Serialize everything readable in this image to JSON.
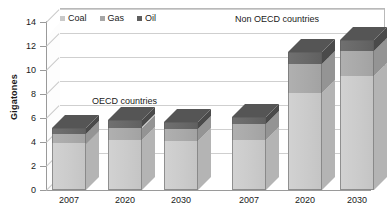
{
  "chart_data": {
    "type": "bar",
    "title": "",
    "subtitle": "",
    "xlabel": "",
    "ylabel": "Gigatones",
    "ylim": [
      0,
      14
    ],
    "ytick_values": [
      0,
      2,
      4,
      6,
      8,
      10,
      12,
      14
    ],
    "ytick_labels": [
      "0",
      "2",
      "4",
      "6",
      "8",
      "10",
      "12",
      "14"
    ],
    "grid": true,
    "stacked": true,
    "three_d": true,
    "legend_position": "top-left",
    "categories": [
      "2007",
      "2020",
      "2030",
      "2007",
      "2020",
      "2030"
    ],
    "groups": [
      {
        "name": "OECD countries",
        "categories": [
          "2007",
          "2020",
          "2030"
        ]
      },
      {
        "name": "Non OECD countries",
        "categories": [
          "2007",
          "2020",
          "2030"
        ]
      }
    ],
    "series": [
      {
        "name": "Coal",
        "color": "#c9c9c9",
        "values": [
          3.9,
          4.2,
          4.1,
          4.2,
          8.1,
          9.5
        ]
      },
      {
        "name": "Gas",
        "color": "#a6a6a6",
        "values": [
          0.8,
          1.0,
          1.0,
          1.3,
          2.4,
          2.1
        ]
      },
      {
        "name": "Oil",
        "color": "#5e5e5e",
        "values": [
          0.5,
          0.6,
          0.6,
          0.6,
          1.0,
          0.9
        ]
      }
    ],
    "totals": [
      5.2,
      5.8,
      5.7,
      6.1,
      11.5,
      12.5
    ],
    "annotations": [
      {
        "text": "OECD countries",
        "x_px": 92,
        "y_px": 97
      },
      {
        "text": "Non OECD countries",
        "x_px": 235,
        "y_px": 15
      }
    ]
  },
  "legend": {
    "items": [
      {
        "label": "Coal",
        "swatch": "coal-swatch"
      },
      {
        "label": "Gas",
        "swatch": "gas-swatch"
      },
      {
        "label": "Oil",
        "swatch": "oil-swatch"
      }
    ]
  },
  "axis": {
    "y_title": "Gigatones"
  }
}
